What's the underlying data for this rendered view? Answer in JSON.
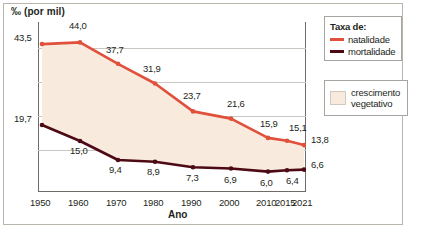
{
  "figure": {
    "y_axis_caption": "‰ (por mil)",
    "x_axis_title": "Ano",
    "credit": "Adilson Secco/ID/BR"
  },
  "legend_rates": {
    "title": "Taxa de:",
    "items": [
      {
        "label": "natalidade",
        "color": "#e0503a"
      },
      {
        "label": "mortalidade",
        "color": "#4d0a14"
      }
    ]
  },
  "legend_growth": {
    "label_line1": "crescimento",
    "label_line2": "vegetativo",
    "color": "#f9eade"
  },
  "chart_data": {
    "type": "line",
    "title": "",
    "xlabel": "Ano",
    "ylabel": "‰ (por mil)",
    "categories": [
      "1950",
      "1960",
      "1970",
      "1980",
      "1990",
      "2000",
      "2010",
      "2015",
      "2021"
    ],
    "x": [
      1950,
      1960,
      1970,
      1980,
      1990,
      2000,
      2010,
      2015,
      2021
    ],
    "series": [
      {
        "name": "natalidade",
        "color": "#e0503a",
        "values": [
          43.5,
          44.0,
          37.7,
          31.9,
          23.7,
          21.6,
          15.9,
          15.1,
          13.8
        ],
        "labels": [
          "43,5",
          "44,0",
          "37,7",
          "31,9",
          "23,7",
          "21,6",
          "15,9",
          "15,1",
          "13,8"
        ]
      },
      {
        "name": "mortalidade",
        "color": "#4d0a14",
        "values": [
          19.7,
          15.0,
          9.4,
          8.9,
          7.3,
          6.9,
          6.0,
          6.4,
          6.6
        ],
        "labels": [
          "19,7",
          "15,0",
          "9,4",
          "8,9",
          "7,3",
          "6,9",
          "6,0",
          "6,4",
          "6,6"
        ]
      }
    ],
    "area_between": {
      "name": "crescimento vegetativo",
      "color": "#f9eade"
    },
    "ylim": [
      0,
      50
    ],
    "grid": true,
    "gridlines": [
      10,
      20,
      30,
      40
    ],
    "legend_position": "right"
  }
}
